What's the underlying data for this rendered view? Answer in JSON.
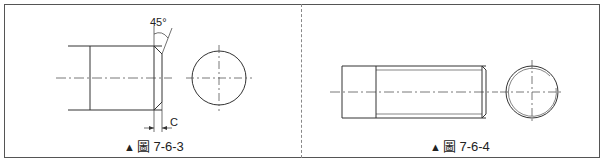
{
  "figures": [
    {
      "id": "fig-7-6-3",
      "caption_marker": "▲",
      "caption": "圖 7-6-3",
      "annotations": {
        "angle": "45°",
        "chamfer_label": "C"
      }
    },
    {
      "id": "fig-7-6-4",
      "caption_marker": "▲",
      "caption": "圖 7-6-4"
    }
  ],
  "colors": {
    "line": "#333333",
    "center_line": "#555555",
    "frame": "#555555"
  }
}
